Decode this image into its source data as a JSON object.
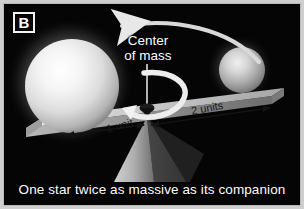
{
  "figure": {
    "panel_letter": "B",
    "caption": "One star twice as massive as its companion",
    "background_color": "#050505",
    "frame_color": "#b9b9b9"
  },
  "annotations": {
    "center_of_mass_line1": "Center",
    "center_of_mass_line2": "of mass",
    "distance_left_label": "1 unit",
    "distance_right_label": "2 units"
  },
  "objects": {
    "massive_star_name": "massive-star-sphere",
    "companion_star_name": "companion-star-sphere",
    "beam_name": "balance-beam",
    "fulcrum_name": "fulcrum-support",
    "pivot_pin_name": "center-of-mass-pin",
    "orbit_arrow_name": "orbit-arc-arrow",
    "rotation_arrow_name": "rotation-loop-arrow"
  },
  "colors": {
    "star_highlight": "#ffffff",
    "star_mid": "#d8d8d8",
    "star_edge": "#6a6a6a",
    "beam_top": "#cfcfcf",
    "beam_side": "#8f8f8f",
    "fulcrum": "#a8a8a8",
    "arrow": "#efefef",
    "label_text": "#ffffff"
  }
}
